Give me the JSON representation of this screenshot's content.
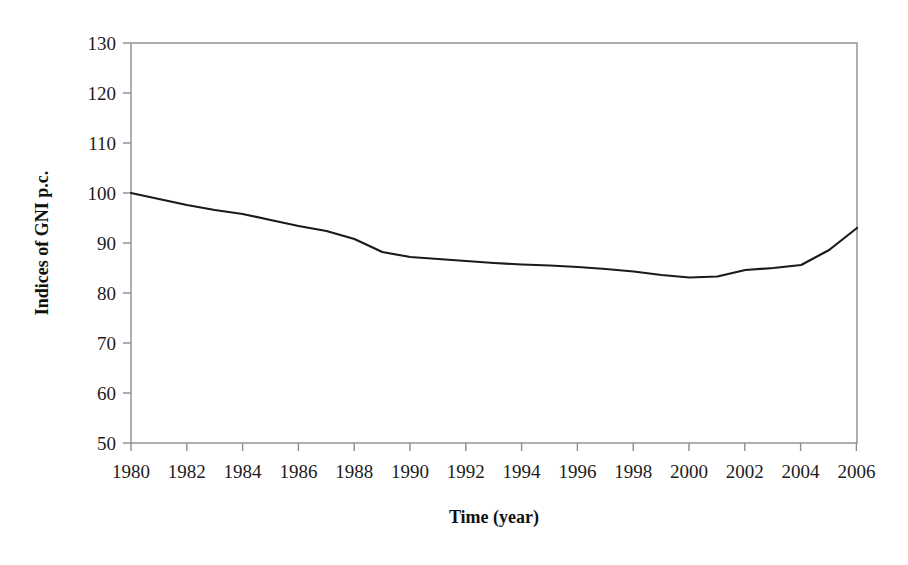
{
  "chart_data": {
    "type": "line",
    "title": "",
    "subtitle": "",
    "xlabel": "Time (year)",
    "ylabel": "Indices of GNI p.c.",
    "xlim": [
      1980,
      2006
    ],
    "ylim": [
      50,
      130
    ],
    "yticks": [
      50,
      60,
      70,
      80,
      90,
      100,
      110,
      120,
      130
    ],
    "xticks": [
      1980,
      1982,
      1984,
      1986,
      1988,
      1990,
      1992,
      1994,
      1996,
      1998,
      2000,
      2002,
      2004,
      2006
    ],
    "xtick_labels": [
      "1980",
      "1982",
      "1984",
      "1986",
      "1988",
      "1990",
      "1992",
      "1994",
      "1996",
      "1998",
      "2000",
      "2002",
      "2004",
      "2006"
    ],
    "ytick_labels": [
      "50",
      "60",
      "70",
      "80",
      "90",
      "100",
      "110",
      "120",
      "130"
    ],
    "grid": false,
    "legend": false,
    "legend_position": "none",
    "line_color": "#1a1a1a",
    "line_width": 2.2,
    "plot_border_color": "#8a8a8a",
    "x": [
      1980,
      1981,
      1982,
      1983,
      1984,
      1985,
      1986,
      1987,
      1988,
      1989,
      1990,
      1991,
      1992,
      1993,
      1994,
      1995,
      1996,
      1997,
      1998,
      1999,
      2000,
      2001,
      2002,
      2003,
      2004,
      2005,
      2006
    ],
    "values": [
      100.0,
      98.8,
      97.6,
      96.6,
      95.8,
      94.6,
      93.4,
      92.4,
      90.8,
      88.2,
      87.2,
      86.8,
      86.4,
      86.0,
      85.7,
      85.5,
      85.2,
      84.8,
      84.3,
      83.6,
      83.1,
      83.3,
      84.6,
      85.0,
      85.6,
      88.6,
      93.0
    ],
    "series": [
      {
        "name": "Indices of GNI p.c.",
        "values": [
          100.0,
          98.8,
          97.6,
          96.6,
          95.8,
          94.6,
          93.4,
          92.4,
          90.8,
          88.2,
          87.2,
          86.8,
          86.4,
          86.0,
          85.7,
          85.5,
          85.2,
          84.8,
          84.3,
          83.6,
          83.1,
          83.3,
          84.6,
          85.0,
          85.6,
          88.6,
          93.0
        ]
      }
    ]
  }
}
